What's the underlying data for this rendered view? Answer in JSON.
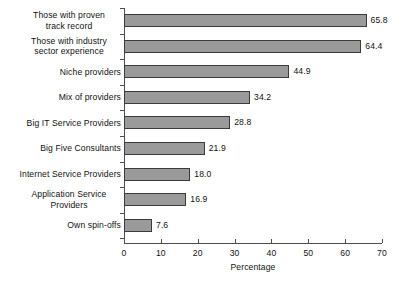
{
  "chart_data": {
    "type": "bar",
    "orientation": "horizontal",
    "title": "",
    "xlabel": "Percentage",
    "ylabel": "",
    "xlim": [
      0,
      70
    ],
    "xticks": [
      0,
      10,
      20,
      30,
      40,
      50,
      60,
      70
    ],
    "grid": false,
    "legend": null,
    "bar_color": "#9a9a9a",
    "bar_edge_color": "#3b3b3b",
    "axis_color": "#4d4d4d",
    "categories": [
      "Those with proven\ntrack record",
      "Those with industry\nsector experience",
      "Niche providers",
      "Mix of providers",
      "Big IT Service Providers",
      "Big Five Consultants",
      "Internet Service Providers",
      "Application Service\nProviders",
      "Own spin-offs"
    ],
    "values": [
      65.8,
      64.4,
      44.9,
      34.2,
      28.8,
      21.9,
      18.0,
      16.9,
      7.6
    ],
    "value_labels": [
      "65.8",
      "64.4",
      "44.9",
      "34.2",
      "28.8",
      "21.9",
      "18.0",
      "16.9",
      "7.6"
    ],
    "xtick_labels": [
      "0",
      "10",
      "20",
      "30",
      "40",
      "50",
      "60",
      "70"
    ]
  }
}
